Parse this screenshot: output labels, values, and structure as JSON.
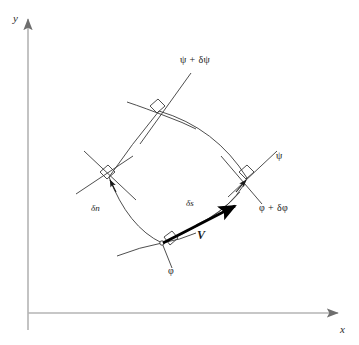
{
  "figure": {
    "background_color": "#ffffff",
    "ink_color": "#2b2b2b",
    "axis_color": "#b0b0b0",
    "vector_color": "#000000"
  },
  "axes": {
    "x_label": "x",
    "y_label": "y",
    "origin": {
      "x": 28,
      "y": 313
    },
    "x_end": {
      "x": 344,
      "y": 313
    },
    "y_end": {
      "x": 28,
      "y": 13
    }
  },
  "streamlines": {
    "lower_label": "ψ",
    "upper_label": "ψ + δψ"
  },
  "equipotentials": {
    "lower_label": "φ",
    "upper_label": "φ + δφ"
  },
  "increments": {
    "normal_label": "δn",
    "streamwise_label": "δs"
  },
  "velocity": {
    "label": "V"
  },
  "labels": {
    "psi": {
      "text": "ψ",
      "x": 278,
      "y": 157
    },
    "psi_plus": {
      "text": "ψ + δψ",
      "x": 180,
      "y": 60
    },
    "phi": {
      "text": "φ",
      "x": 168,
      "y": 272
    },
    "phi_plus": {
      "text": "φ + δφ",
      "x": 259,
      "y": 208
    },
    "delta_n": {
      "text": "δn",
      "x": 91,
      "y": 209
    },
    "delta_s": {
      "text": "δs",
      "x": 186,
      "y": 204
    },
    "vee": {
      "text": "V",
      "x": 197,
      "y": 236
    },
    "x_axis": {
      "text": "x",
      "x": 340,
      "y": 331
    },
    "y_axis": {
      "text": "y",
      "x": 13,
      "y": 20
    }
  },
  "cell": {
    "vertices": {
      "top": {
        "x": 159,
        "y": 111
      },
      "left": {
        "x": 109,
        "y": 177
      },
      "right": {
        "x": 247,
        "y": 178
      },
      "bottom": {
        "x": 162,
        "y": 243
      }
    },
    "right_angle_markers": 4
  }
}
